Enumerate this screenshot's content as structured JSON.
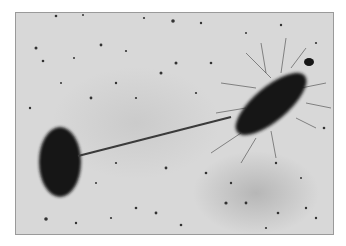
{
  "image": {
    "subject": "micrograph of two bacteria connected by a pilus",
    "colors": {
      "background": "#d8d8d8",
      "cell": "#151515",
      "border": "#9a9a9a",
      "page": "#ffffff"
    }
  }
}
